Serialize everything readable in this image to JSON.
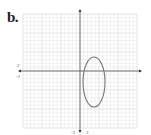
{
  "figure": {
    "label": "b.",
    "grid": {
      "x0": 23,
      "y0": 14,
      "x1": 137,
      "y1": 128,
      "cell": 3.8,
      "color": "#d9d9d9",
      "major_color": "#c8c8c8"
    },
    "axes": {
      "origin_x": 80,
      "origin_y": 71,
      "color": "#555555"
    },
    "ellipse": {
      "cx": 94,
      "cy": 82,
      "rx": 11,
      "ry": 25,
      "stroke": "#777777"
    },
    "tick_labels": {
      "y_pos": "2",
      "y_neg": "-2",
      "x_neg": "-2",
      "x_pos": "2"
    }
  },
  "chart_data": {
    "type": "diagram",
    "title": "b.",
    "shape": "ellipse",
    "tick_labels": [
      "2",
      "-2",
      "-2",
      "2"
    ]
  }
}
